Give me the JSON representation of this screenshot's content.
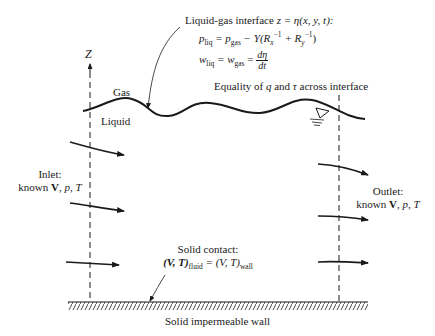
{
  "diagram": {
    "type": "boundary-conditions-schematic",
    "axis": {
      "label": "Z"
    },
    "regions": {
      "gas": "Gas",
      "liquid": "Liquid"
    },
    "interface": {
      "title_prefix": "Liquid-gas interface ",
      "title_eq": "z = η(x, y, t):",
      "pressure_lhs": "p",
      "pressure_lhs_sub": "liq",
      "pressure_eq": " = p",
      "pressure_gas_sub": "gas",
      "pressure_rest": " − Υ(R",
      "rx_sub": "x",
      "rx_sup": "−1",
      "plus": " + R",
      "ry_sub": "y",
      "ry_sup": "−1",
      "close": ")",
      "w_lhs": "w",
      "w_lhs_sub": "liq",
      "w_eq": " = w",
      "w_gas_sub": "gas",
      "w_eq2": " = ",
      "frac_num": "dη",
      "frac_den": "dt",
      "equality_prefix": "Equality of ",
      "q": "q",
      "and": " and ",
      "tau": "τ",
      "equality_suffix": " across interface"
    },
    "inlet": {
      "line1": "Inlet:",
      "line2_prefix": "known ",
      "V": "V",
      "rest": ", p, T"
    },
    "outlet": {
      "line1": "Outlet:",
      "line2_prefix": "known ",
      "V": "V",
      "rest": ", p, T"
    },
    "solid_contact": {
      "line1": "Solid contact:",
      "lhs": "(V, T)",
      "lhs_sub": "fluid",
      "eq": " = (V, T)",
      "rhs_sub": "wall"
    },
    "wall": {
      "label": "Solid impermeable wall"
    },
    "free_surface_symbol": "▽"
  }
}
